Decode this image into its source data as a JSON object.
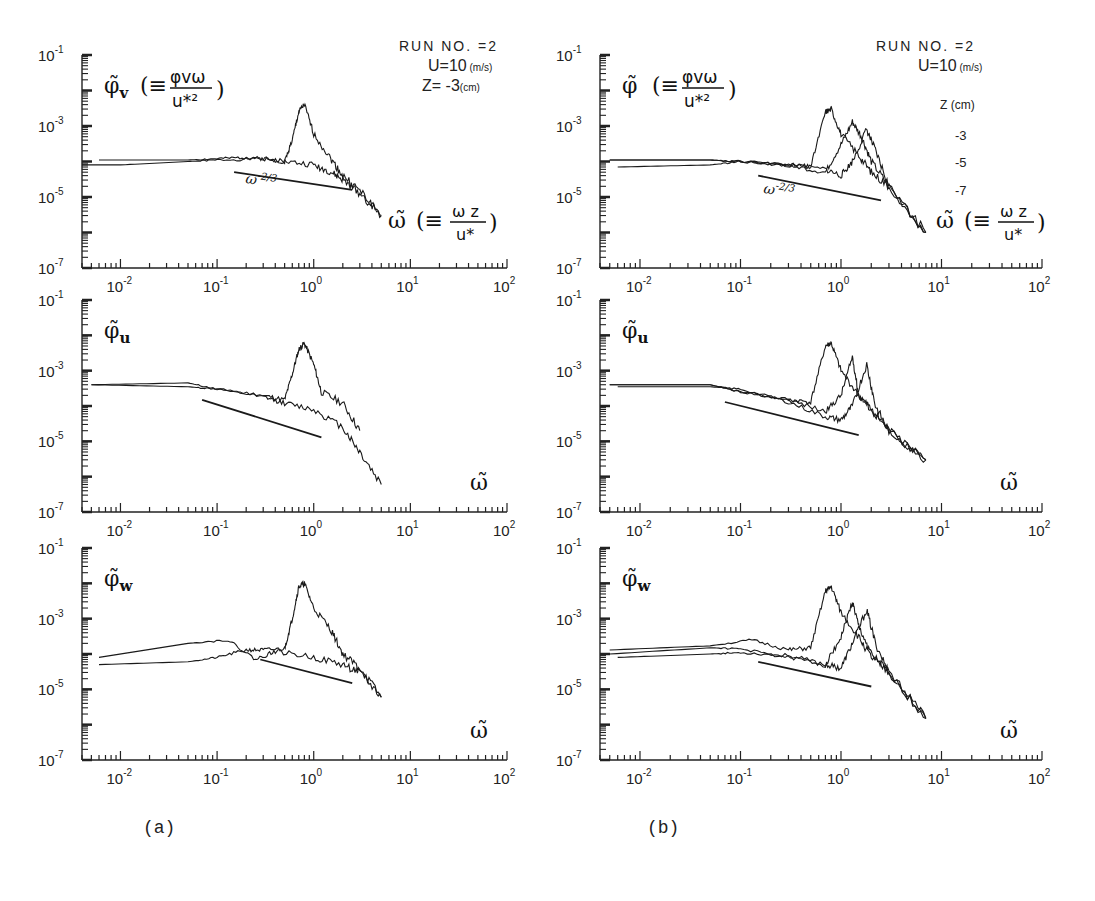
{
  "figure": {
    "panel_labels": [
      "(a)",
      "(b)"
    ]
  },
  "annotations": {
    "a": {
      "run": "RUN NO. =2",
      "wind": "U=10",
      "wind_unit": "(m/s)",
      "depth": "Z= -3",
      "depth_unit": "(cm)"
    },
    "b": {
      "run": "RUN NO. =2",
      "wind": "U=10",
      "wind_unit": "(m/s)",
      "depth_header": "Z (cm)",
      "depths": [
        "-3",
        "-5",
        "-7"
      ]
    }
  },
  "labels": {
    "phi_v": "φ̃v(≡φvω/u*²)",
    "phi": "φ̃(≡φvω/u*²)",
    "phi_u": "φ̃u",
    "phi_w": "φ̃w",
    "omega_full": "ω̃(≡ωz/u*)",
    "omega": "ω̃",
    "slope": "ω^-2/3"
  },
  "chart_data": [
    {
      "type": "line",
      "panel": "a-top",
      "title": "",
      "xlabel": "ω̃ (≡ωz/u*)",
      "ylabel": "φ̃v (≡φvω/u*²)",
      "xscale": "log",
      "yscale": "log",
      "xlim": [
        0.004,
        100
      ],
      "ylim": [
        1e-07,
        0.1
      ],
      "xticks": [
        "10^-2",
        "10^-1",
        "10^0",
        "10^1",
        "10^2"
      ],
      "yticks": [
        "10^-7",
        "10^-5",
        "10^-3",
        "10^-1"
      ],
      "annotations": [
        "RUN NO. =2",
        "U=10 (m/s)",
        "Z= -3 (cm)",
        "ω^-2/3"
      ],
      "series": [
        {
          "name": "spectrum 1 (peaked)",
          "x": [
            0.004,
            0.01,
            0.05,
            0.1,
            0.3,
            0.5,
            0.6,
            0.7,
            0.8,
            1.0,
            1.5,
            2,
            3,
            5
          ],
          "y": [
            8e-05,
            8e-05,
            0.0001,
            0.00011,
            0.00012,
            0.0001,
            0.0004,
            0.0025,
            0.004,
            0.0006,
            0.00012,
            4e-05,
            1.5e-05,
            3e-06
          ]
        },
        {
          "name": "spectrum 2",
          "x": [
            0.006,
            0.05,
            0.1,
            0.2,
            0.3,
            0.5,
            1.0,
            1.5,
            2,
            3,
            5
          ],
          "y": [
            0.00011,
            0.00011,
            0.00012,
            0.00013,
            0.00012,
            0.0001,
            8e-05,
            5e-05,
            3e-05,
            1.3e-05,
            3e-06
          ]
        },
        {
          "name": "ω^-2/3 reference",
          "x": [
            0.15,
            2.5
          ],
          "y": [
            5e-05,
            1.6e-05
          ]
        }
      ]
    },
    {
      "type": "line",
      "panel": "a-middle",
      "xlabel": "ω̃",
      "ylabel": "φ̃u",
      "xscale": "log",
      "yscale": "log",
      "xlim": [
        0.004,
        100
      ],
      "ylim": [
        1e-07,
        0.1
      ],
      "xticks": [
        "10^-2",
        "10^-1",
        "10^0",
        "10^1",
        "10^2"
      ],
      "yticks": [
        "10^-7",
        "10^-5",
        "10^-3",
        "10^-1"
      ],
      "series": [
        {
          "name": "spectrum 1 (peaked)",
          "x": [
            0.005,
            0.05,
            0.1,
            0.3,
            0.5,
            0.6,
            0.7,
            0.8,
            1.0,
            1.2,
            2,
            3
          ],
          "y": [
            0.0004,
            0.00045,
            0.0003,
            0.0002,
            0.00015,
            0.0008,
            0.004,
            0.006,
            0.0015,
            0.00025,
            0.00012,
            2e-05
          ]
        },
        {
          "name": "spectrum 2",
          "x": [
            0.005,
            0.05,
            0.1,
            0.3,
            0.5,
            1.0,
            2,
            3,
            5
          ],
          "y": [
            0.0004,
            0.00035,
            0.0003,
            0.00018,
            0.00012,
            8e-05,
            2.5e-05,
            5e-06,
            6e-07
          ]
        },
        {
          "name": "ω^-2/3 reference",
          "x": [
            0.07,
            1.2
          ],
          "y": [
            0.00015,
            1.3e-05
          ]
        }
      ]
    },
    {
      "type": "line",
      "panel": "a-bottom",
      "xlabel": "ω̃",
      "ylabel": "φ̃w",
      "xscale": "log",
      "yscale": "log",
      "xlim": [
        0.004,
        100
      ],
      "ylim": [
        1e-07,
        0.1
      ],
      "xticks": [
        "10^-2",
        "10^-1",
        "10^0",
        "10^1",
        "10^2"
      ],
      "yticks": [
        "10^-7",
        "10^-5",
        "10^-3",
        "10^-1"
      ],
      "series": [
        {
          "name": "spectrum 1 (peaked)",
          "x": [
            0.006,
            0.05,
            0.1,
            0.2,
            0.3,
            0.5,
            0.6,
            0.7,
            0.8,
            1.0,
            1.5,
            2,
            3,
            5
          ],
          "y": [
            5e-05,
            6e-05,
            8e-05,
            0.00013,
            0.00013,
            0.00014,
            0.001,
            0.008,
            0.01,
            0.002,
            0.0005,
            0.0001,
            4e-05,
            6e-06
          ]
        },
        {
          "name": "spectrum 2",
          "x": [
            0.006,
            0.05,
            0.13,
            0.25,
            0.4,
            1.0,
            2,
            3,
            5
          ],
          "y": [
            8e-05,
            0.0002,
            0.00025,
            7e-05,
            0.00012,
            8e-05,
            5e-05,
            3e-05,
            6e-06
          ]
        },
        {
          "name": "ω^-2/3 reference",
          "x": [
            0.28,
            2.5
          ],
          "y": [
            7e-05,
            1.5e-05
          ]
        }
      ]
    },
    {
      "type": "line",
      "panel": "b-top",
      "xlabel": "ω̃ (≡ωz/u*)",
      "ylabel": "φ̃ (≡φvω/u*²)",
      "xscale": "log",
      "yscale": "log",
      "xlim": [
        0.004,
        100
      ],
      "ylim": [
        1e-07,
        0.1
      ],
      "xticks": [
        "10^-2",
        "10^-1",
        "10^0",
        "10^1",
        "10^2"
      ],
      "yticks": [
        "10^-7",
        "10^-5",
        "10^-3",
        "10^-1"
      ],
      "legend": {
        "title": "Z (cm)",
        "entries": [
          "-3",
          "-5",
          "-7"
        ],
        "position": "upper right"
      },
      "annotations": [
        "RUN NO. =2",
        "U=10 (m/s)",
        "ω^-2/3"
      ],
      "series": [
        {
          "name": "Z=-3",
          "x": [
            0.005,
            0.05,
            0.1,
            0.3,
            0.5,
            0.7,
            0.8,
            1.0,
            1.5,
            2,
            3,
            7
          ],
          "y": [
            0.00011,
            0.00011,
            0.0001,
            8e-05,
            7e-05,
            0.0025,
            0.003,
            0.0006,
            0.00015,
            5e-05,
            2e-05,
            1e-06
          ]
        },
        {
          "name": "Z=-5",
          "x": [
            0.005,
            0.05,
            0.1,
            0.3,
            0.7,
            1.0,
            1.3,
            1.6,
            2,
            3,
            7
          ],
          "y": [
            0.00011,
            0.00011,
            0.0001,
            8e-05,
            5e-05,
            0.0003,
            0.0013,
            0.0005,
            0.0001,
            2e-05,
            1e-06
          ]
        },
        {
          "name": "Z=-7",
          "x": [
            0.006,
            0.05,
            0.1,
            0.3,
            0.7,
            1.0,
            1.3,
            1.8,
            2.2,
            3,
            7
          ],
          "y": [
            7e-05,
            8e-05,
            0.0001,
            8e-05,
            6e-05,
            4e-05,
            0.0001,
            0.0008,
            0.0002,
            2e-05,
            1e-06
          ]
        },
        {
          "name": "ω^-2/3 reference",
          "x": [
            0.15,
            2.5
          ],
          "y": [
            4e-05,
            8e-06
          ]
        }
      ]
    },
    {
      "type": "line",
      "panel": "b-middle",
      "xlabel": "ω̃",
      "ylabel": "φ̃u",
      "xscale": "log",
      "yscale": "log",
      "xlim": [
        0.004,
        100
      ],
      "ylim": [
        1e-07,
        0.1
      ],
      "xticks": [
        "10^-2",
        "10^-1",
        "10^0",
        "10^1",
        "10^2"
      ],
      "yticks": [
        "10^-7",
        "10^-5",
        "10^-3",
        "10^-1"
      ],
      "series": [
        {
          "name": "Z=-3",
          "x": [
            0.005,
            0.05,
            0.1,
            0.3,
            0.5,
            0.7,
            0.8,
            1.0,
            1.5,
            2,
            3,
            7
          ],
          "y": [
            0.0004,
            0.0004,
            0.00025,
            0.00015,
            0.00013,
            0.005,
            0.006,
            0.001,
            0.0002,
            8e-05,
            2e-05,
            3e-06
          ]
        },
        {
          "name": "Z=-5",
          "x": [
            0.005,
            0.05,
            0.1,
            0.3,
            0.7,
            1.0,
            1.3,
            1.5,
            2,
            3,
            7
          ],
          "y": [
            0.0004,
            0.0004,
            0.00025,
            0.00015,
            7e-05,
            0.0002,
            0.0025,
            0.0002,
            8e-05,
            2e-05,
            3e-06
          ]
        },
        {
          "name": "Z=-7",
          "x": [
            0.006,
            0.05,
            0.1,
            0.3,
            0.7,
            1.0,
            1.3,
            1.8,
            2.2,
            3,
            7
          ],
          "y": [
            0.00035,
            0.00035,
            0.0003,
            0.00013,
            5e-05,
            4e-05,
            0.0001,
            0.0015,
            0.0001,
            2e-05,
            3e-06
          ]
        },
        {
          "name": "ω^-2/3 reference",
          "x": [
            0.07,
            1.5
          ],
          "y": [
            0.00013,
            1.5e-05
          ]
        }
      ]
    },
    {
      "type": "line",
      "panel": "b-bottom",
      "xlabel": "ω̃",
      "ylabel": "φ̃w",
      "xscale": "log",
      "yscale": "log",
      "xlim": [
        0.004,
        100
      ],
      "ylim": [
        1e-07,
        0.1
      ],
      "xticks": [
        "10^-2",
        "10^-1",
        "10^0",
        "10^1",
        "10^2"
      ],
      "yticks": [
        "10^-7",
        "10^-5",
        "10^-3",
        "10^-1"
      ],
      "series": [
        {
          "name": "Z=-3",
          "x": [
            0.005,
            0.05,
            0.13,
            0.3,
            0.5,
            0.7,
            0.8,
            1.0,
            1.5,
            2,
            3,
            7
          ],
          "y": [
            0.00013,
            0.00017,
            0.00025,
            0.00013,
            0.00015,
            0.006,
            0.008,
            0.0015,
            0.0003,
            8e-05,
            3e-05,
            1.5e-06
          ]
        },
        {
          "name": "Z=-5",
          "x": [
            0.005,
            0.05,
            0.1,
            0.3,
            0.7,
            1.0,
            1.3,
            1.5,
            2,
            3,
            7
          ],
          "y": [
            0.0001,
            0.00015,
            0.00014,
            8e-05,
            5e-05,
            0.0003,
            0.003,
            0.0006,
            0.0001,
            3e-05,
            1.5e-06
          ]
        },
        {
          "name": "Z=-7",
          "x": [
            0.006,
            0.05,
            0.1,
            0.3,
            0.7,
            1.0,
            1.3,
            1.8,
            2.2,
            3,
            7
          ],
          "y": [
            8e-05,
            0.0001,
            0.00011,
            9e-05,
            5e-05,
            4e-05,
            0.0002,
            0.0018,
            0.0002,
            3e-05,
            1.5e-06
          ]
        },
        {
          "name": "ω^-2/3 reference",
          "x": [
            0.15,
            2.0
          ],
          "y": [
            6e-05,
            1.2e-05
          ]
        }
      ]
    }
  ]
}
